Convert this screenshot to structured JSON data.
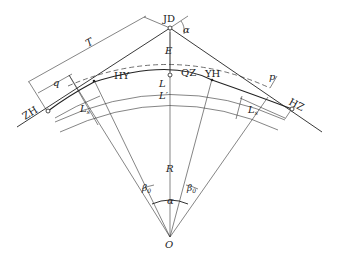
{
  "diagram": {
    "points": {
      "jd": "JD",
      "zh": "ZH",
      "hy": "HY",
      "qz": "QZ",
      "yh": "YH",
      "hz": "HZ",
      "o": "O"
    },
    "dimensions": {
      "tangent_length": "T",
      "q": "q",
      "external_distance": "E",
      "shift": "p",
      "radius": "R",
      "curve_length": "L",
      "circular_length": "L′",
      "spiral_length_left": "L",
      "spiral_length_left_sub": "s",
      "spiral_length_right": "L",
      "spiral_length_right_sub": "s"
    },
    "angles": {
      "deflection": "α",
      "central": "α",
      "spiral_left": "β",
      "spiral_left_sub": "0",
      "spiral_right": "β",
      "spiral_right_sub": "0"
    }
  }
}
